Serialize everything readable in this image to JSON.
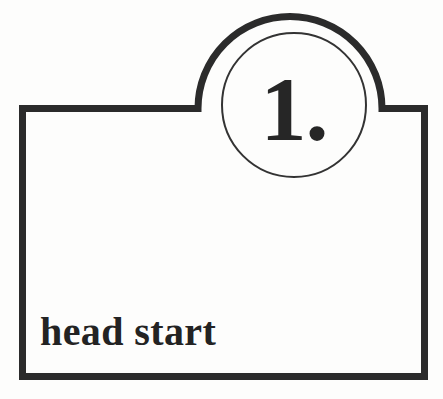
{
  "figure": {
    "kind": "numbered-step-callout-box",
    "badge": {
      "number_label": "1.",
      "shape": "circle"
    },
    "caption": {
      "text": "head start"
    },
    "colors": {
      "ink": "#262626",
      "stroke": "#2b2b2b",
      "background": "#fdfdfc",
      "inner_circle_stroke": "#333333"
    },
    "geometry": {
      "box_left": 22,
      "box_top": 108,
      "box_right": 425,
      "box_bottom": 377,
      "stroke_width": 7,
      "arc_center_x": 290,
      "arc_radius": 92,
      "inner_circle_center_x": 294,
      "inner_circle_center_y": 105,
      "inner_circle_radius": 72,
      "inner_circle_stroke_width": 2
    }
  }
}
